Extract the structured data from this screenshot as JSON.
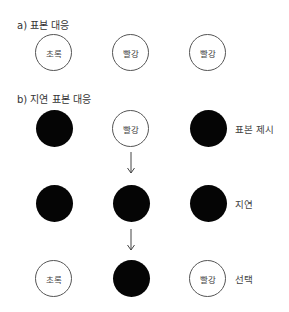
{
  "section_a": {
    "title": "a) 표본 대응",
    "circles": [
      {
        "label": "초록",
        "filled": false
      },
      {
        "label": "빨강",
        "filled": false
      },
      {
        "label": "빨강",
        "filled": false
      }
    ]
  },
  "section_b": {
    "title": "b) 지연 표본 대응",
    "rows": [
      {
        "side_label": "표본 제시",
        "circles": [
          {
            "label": "",
            "filled": true
          },
          {
            "label": "빨강",
            "filled": false
          },
          {
            "label": "",
            "filled": true
          }
        ]
      },
      {
        "side_label": "지연",
        "circles": [
          {
            "label": "",
            "filled": true
          },
          {
            "label": "",
            "filled": true
          },
          {
            "label": "",
            "filled": true
          }
        ]
      },
      {
        "side_label": "선택",
        "circles": [
          {
            "label": "초록",
            "filled": false
          },
          {
            "label": "",
            "filled": true
          },
          {
            "label": "빨강",
            "filled": false
          }
        ]
      }
    ],
    "arrows": [
      "down-arrow",
      "down-arrow"
    ]
  }
}
